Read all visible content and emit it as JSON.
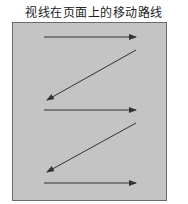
{
  "title": "视线在页面上的移动路线",
  "diagram": {
    "page_fill": "#c4c4c4",
    "border_color": "#6a6a6a",
    "arrow_color": "#333333",
    "arrows": [
      {
        "from": [
          44,
          37
        ],
        "to": [
          136,
          37
        ],
        "direction": "left-to-right"
      },
      {
        "from": [
          136,
          50
        ],
        "to": [
          47,
          100
        ],
        "direction": "diagonal-down-left"
      },
      {
        "from": [
          44,
          110
        ],
        "to": [
          136,
          110
        ],
        "direction": "left-to-right"
      },
      {
        "from": [
          136,
          123
        ],
        "to": [
          47,
          172
        ],
        "direction": "diagonal-down-left"
      },
      {
        "from": [
          44,
          183
        ],
        "to": [
          136,
          183
        ],
        "direction": "left-to-right"
      }
    ]
  }
}
